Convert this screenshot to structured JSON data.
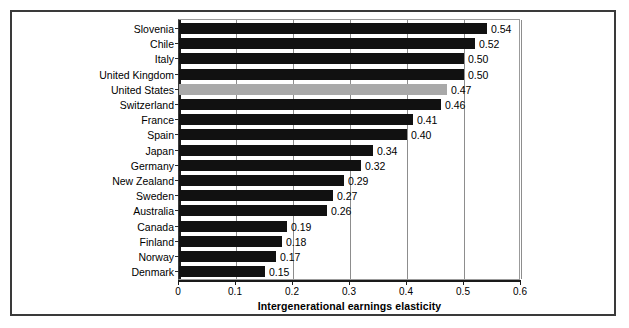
{
  "chart_data": {
    "type": "bar",
    "orientation": "horizontal",
    "title": "",
    "xlabel": "Intergenerational earnings elasticity",
    "ylabel": "",
    "xlim": [
      0,
      0.6
    ],
    "xticks": [
      "0",
      "0.1",
      "0.2",
      "0.3",
      "0.4",
      "0.5",
      "0.6"
    ],
    "xtick_values": [
      0,
      0.1,
      0.2,
      0.3,
      0.4,
      0.5,
      0.6
    ],
    "grid": "vertical",
    "legend": "none",
    "categories": [
      "Slovenia",
      "Chile",
      "Italy",
      "United Kingdom",
      "United States",
      "Switzerland",
      "France",
      "Spain",
      "Japan",
      "Germany",
      "New Zealand",
      "Sweden",
      "Australia",
      "Canada",
      "Finland",
      "Norway",
      "Denmark"
    ],
    "values": [
      0.54,
      0.52,
      0.5,
      0.5,
      0.47,
      0.46,
      0.41,
      0.4,
      0.34,
      0.32,
      0.29,
      0.27,
      0.26,
      0.19,
      0.18,
      0.17,
      0.15
    ],
    "data_labels": [
      "0.54",
      "0.52",
      "0.50",
      "0.50",
      "0.47",
      "0.46",
      "0.41",
      "0.40",
      "0.34",
      "0.32",
      "0.29",
      "0.27",
      "0.26",
      "0.19",
      "0.18",
      "0.17",
      "0.15"
    ],
    "highlighted_category": "United States",
    "colors": {
      "bar": "#111111",
      "highlight_bar": "#a9a9a9",
      "gridline": "#8d8d8d",
      "axis": "#1a1a1a",
      "frame": "#3a3a3a",
      "background": "#ffffff",
      "text": "#000000"
    }
  }
}
